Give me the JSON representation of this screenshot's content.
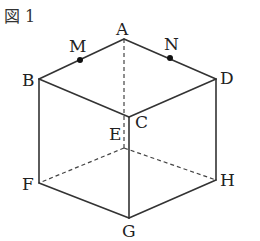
{
  "figure": {
    "title": "図 1",
    "vertices": {
      "A": {
        "label": "A",
        "x": 124,
        "y": 39
      },
      "B": {
        "label": "B",
        "x": 39,
        "y": 79
      },
      "C": {
        "label": "C",
        "x": 129,
        "y": 117
      },
      "D": {
        "label": "D",
        "x": 216,
        "y": 79
      },
      "E": {
        "label": "E",
        "x": 124,
        "y": 148
      },
      "F": {
        "label": "F",
        "x": 39,
        "y": 183
      },
      "G": {
        "label": "G",
        "x": 129,
        "y": 218
      },
      "H": {
        "label": "H",
        "x": 216,
        "y": 180
      }
    },
    "points": {
      "M": {
        "label": "M",
        "x": 80,
        "y": 60
      },
      "N": {
        "label": "N",
        "x": 170,
        "y": 58
      }
    },
    "visible_edges": [
      [
        "A",
        "B"
      ],
      [
        "A",
        "D"
      ],
      [
        "B",
        "C"
      ],
      [
        "C",
        "D"
      ],
      [
        "B",
        "F"
      ],
      [
        "C",
        "G"
      ],
      [
        "D",
        "H"
      ],
      [
        "F",
        "G"
      ],
      [
        "G",
        "H"
      ]
    ],
    "hidden_edges": [
      [
        "A",
        "E"
      ],
      [
        "E",
        "F"
      ],
      [
        "E",
        "H"
      ]
    ]
  }
}
